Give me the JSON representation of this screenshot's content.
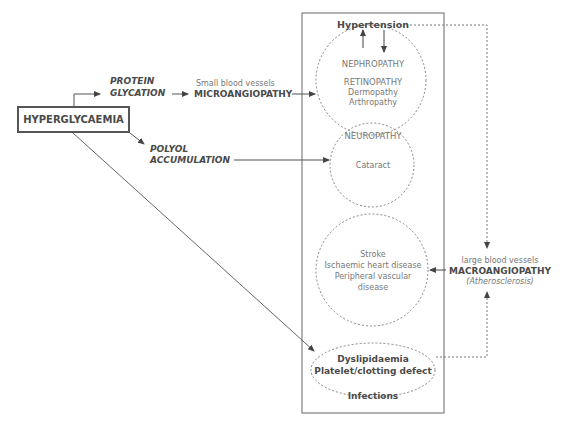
{
  "diagram": {
    "root": {
      "label": "HYPERGLYCAEMIA"
    },
    "pathways": {
      "protein_glycation": [
        "PROTEIN",
        "GLYCATION"
      ],
      "polyol_accumulation": [
        "POLYOL",
        "ACCUMULATION"
      ]
    },
    "microangiopathy": {
      "subtitle": "Small blood vessels",
      "label": "MICROANGIOPATHY"
    },
    "macroangiopathy": {
      "subtitle": "large blood vessels",
      "label": "MACROANGIOPATHY",
      "note": "(Atherosclerosis)"
    },
    "complications_box": {
      "hypertension": "Hypertension",
      "micro_circle": [
        "NEPHROPATHY",
        "RETINOPATHY",
        "Dermopathy",
        "Arthropathy"
      ],
      "neuropathy_circle": [
        "NEUROPATHY",
        "Cataract"
      ],
      "macro_circle": [
        "Stroke",
        "Ischaemic heart disease",
        "Peripheral vascular",
        "disease"
      ],
      "lipid_ellipse": [
        "Dyslipidaemia",
        "Platelet/clotting defect"
      ],
      "infections": "Infections"
    },
    "colors": {
      "line": "#555555",
      "text": "#555555",
      "dashed": "#777777"
    }
  }
}
